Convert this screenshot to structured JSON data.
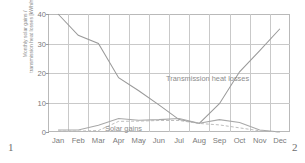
{
  "page_markers": {
    "left": "1",
    "right": "2"
  },
  "chart_data": {
    "type": "line",
    "title": "",
    "xlabel": "",
    "ylabel_lines": [
      "Monthly solar gains /",
      "transmission heat losses [kWh/m²]"
    ],
    "ylabel": "Monthly solar gains / transmission heat losses [kWh/m²]",
    "categories": [
      "Jan",
      "Feb",
      "Mar",
      "Apr",
      "May",
      "Jun",
      "Jul",
      "Aug",
      "Sep",
      "Oct",
      "Nov",
      "Dec"
    ],
    "ylim": [
      0,
      40
    ],
    "yticks": [
      0,
      10,
      20,
      30,
      40
    ],
    "grid": true,
    "legend_position": "inline-annotations",
    "annotations": [
      {
        "text": "Transmission heat losses",
        "series": "transmission_heat_losses"
      },
      {
        "text": "Solar gains",
        "series": "solar_gains"
      }
    ],
    "series": [
      {
        "name": "Transmission heat losses",
        "style": "solid",
        "color": "#9a9a9a",
        "values": [
          40.0,
          32.8,
          30.0,
          18.4,
          14.0,
          9.2,
          4.2,
          2.9,
          9.6,
          20.4,
          27.6,
          35.0
        ]
      },
      {
        "name": "Solar gains (solid)",
        "style": "solid",
        "color": "#a8a8a8",
        "values": [
          0.7,
          0.7,
          2.3,
          4.6,
          4.0,
          4.2,
          4.6,
          3.0,
          4.2,
          3.2,
          0.7,
          0.0
        ]
      },
      {
        "name": "Solar gains (dashed)",
        "style": "dashed",
        "color": "#b5b5b5",
        "values": [
          0.3,
          0.3,
          0.5,
          3.6,
          3.7,
          3.9,
          3.9,
          2.9,
          2.4,
          1.4,
          0.4,
          0.0
        ]
      }
    ]
  }
}
